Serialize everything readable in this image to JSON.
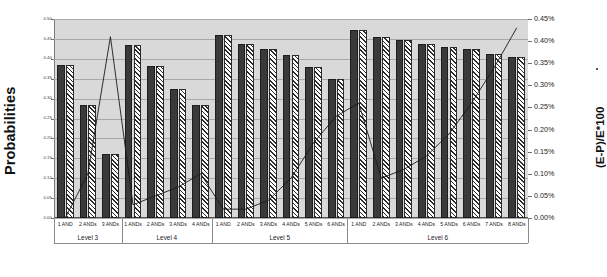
{
  "axes": {
    "left_title": "Probabilities",
    "right_title": "(E-P)/E*100",
    "left_ticks": [
      "0.50",
      "0.45",
      "0.40",
      "0.35",
      "0.30",
      "0.25",
      "0.20",
      "0.15",
      "0.10",
      "0.05",
      "0.00"
    ],
    "right_ticks": [
      "0.45%",
      "0.40%",
      "0.35%",
      "0.30%",
      "0.25%",
      "0.20%",
      "0.15%",
      "0.10%",
      "0.05%",
      "0.00%"
    ]
  },
  "levels": [
    {
      "label": "Level 3",
      "count": 3
    },
    {
      "label": "Level 4",
      "count": 4
    },
    {
      "label": "Level 5",
      "count": 6
    },
    {
      "label": "Level 6",
      "count": 8
    }
  ],
  "chart_data": {
    "type": "bar",
    "title": "",
    "xlabel": "",
    "ylabel": "Probabilities",
    "y2label": "(E-P)/E*100",
    "ylim": [
      0.0,
      0.5
    ],
    "y2lim": [
      0.0,
      0.0045
    ],
    "grid": true,
    "legend": "none",
    "categories": [
      "1 AND",
      "2 ANDs",
      "3 ANDs",
      "1 ANDs",
      "2 ANDs",
      "3 ANDs",
      "4 ANDs",
      "1 AND",
      "2 ANDs",
      "3 ANDs",
      "4 ANDs",
      "5 ANDs",
      "6 ANDs",
      "1 AND",
      "2 ANDs",
      "3 ANDs",
      "4 ANDs",
      "5 ANDs",
      "6 ANDs",
      "7 ANDs",
      "8 ANDs"
    ],
    "group_labels": [
      "Level 3",
      "Level 4",
      "Level 5",
      "Level 6"
    ],
    "group_sizes": [
      3,
      4,
      6,
      8
    ],
    "series": [
      {
        "name": "Expected",
        "style": "solid-dark",
        "values": [
          0.385,
          0.285,
          0.16,
          0.435,
          0.383,
          0.325,
          0.285,
          0.46,
          0.438,
          0.425,
          0.41,
          0.38,
          0.35,
          0.472,
          0.455,
          0.448,
          0.438,
          0.43,
          0.425,
          0.412,
          0.405
        ]
      },
      {
        "name": "Predicted",
        "style": "hatched",
        "values": [
          0.385,
          0.285,
          0.16,
          0.435,
          0.383,
          0.325,
          0.285,
          0.46,
          0.438,
          0.425,
          0.41,
          0.38,
          0.35,
          0.472,
          0.455,
          0.448,
          0.438,
          0.43,
          0.425,
          0.412,
          0.405
        ]
      },
      {
        "name": "(E-P)/E*100",
        "style": "line",
        "axis": "right",
        "values": [
          0.0,
          0.001,
          0.0041,
          0.0003,
          0.0005,
          0.0007,
          0.001,
          0.0002,
          0.0002,
          0.0004,
          0.0009,
          0.0017,
          0.0023,
          0.0026,
          0.0009,
          0.0011,
          0.0014,
          0.0019,
          0.0026,
          0.0034,
          0.0043
        ]
      }
    ]
  }
}
